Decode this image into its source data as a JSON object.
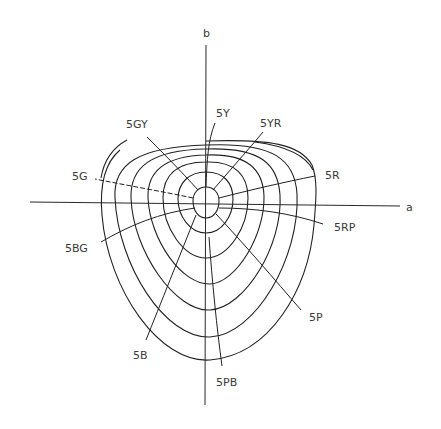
{
  "diagram": {
    "type": "munsell-hue-chroma-diagram-in-ab-plane",
    "axes": {
      "horizontal_label": "a",
      "vertical_label": "b"
    },
    "center": {
      "x": 206,
      "y": 200
    },
    "contour_count": 7,
    "hue_rays": [
      {
        "label": "5Y",
        "x": 216,
        "y": 117
      },
      {
        "label": "5YR",
        "x": 260,
        "y": 127
      },
      {
        "label": "5GY",
        "x": 126,
        "y": 128
      },
      {
        "label": "5R",
        "x": 325,
        "y": 179
      },
      {
        "label": "5G",
        "x": 72,
        "y": 180
      },
      {
        "label": "5RP",
        "x": 334,
        "y": 231
      },
      {
        "label": "5BG",
        "x": 65,
        "y": 252
      },
      {
        "label": "5P",
        "x": 309,
        "y": 321
      },
      {
        "label": "5B",
        "x": 133,
        "y": 359
      },
      {
        "label": "5PB",
        "x": 216,
        "y": 386
      }
    ],
    "colors": {
      "line": "#222222",
      "text": "#3a3a3a",
      "background": "#ffffff"
    }
  }
}
